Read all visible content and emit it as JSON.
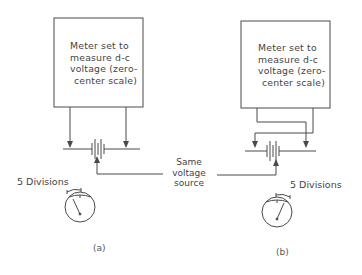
{
  "diagram": {
    "panel_a": {
      "meter_box_lines": [
        "Meter set to",
        "measure  d-c",
        "voltage (zero-",
        "center scale)"
      ],
      "deflection_label": "5  Divisions",
      "caption": "(a)",
      "lead_connection": "direct"
    },
    "panel_b": {
      "meter_box_lines": [
        "Meter set to",
        "measure  d-c",
        "voltage (zero-",
        "center scale)"
      ],
      "deflection_label": "5  Divisions",
      "caption": "(b)",
      "lead_connection": "reversed"
    },
    "shared_label_lines": [
      "Same",
      "voltage",
      "source"
    ],
    "colors": {
      "line": "#4a4a4a",
      "background": "#ffffff"
    }
  }
}
